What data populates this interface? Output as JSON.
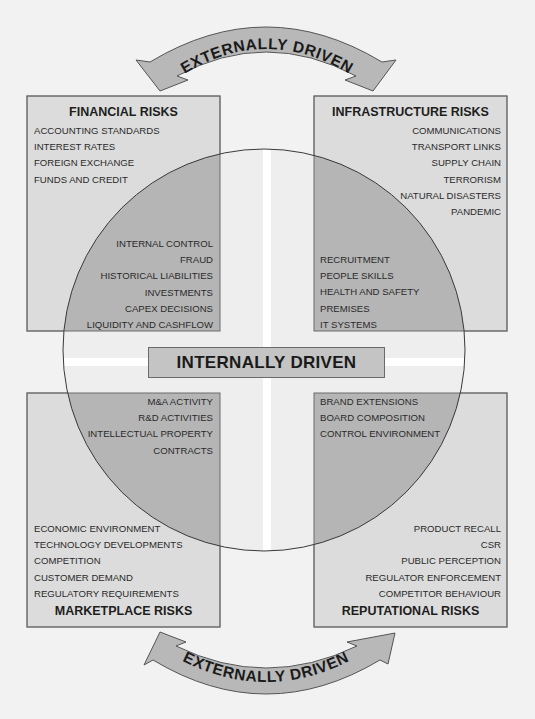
{
  "top_arrow": {
    "label": "EXTERNALLY DRIVEN"
  },
  "bottom_arrow": {
    "label": "EXTERNALLY DRIVEN"
  },
  "center": {
    "label": "INTERNALLY DRIVEN"
  },
  "quadrants": {
    "financial": {
      "title": "FINANCIAL RISKS",
      "external_items": [
        "ACCOUNTING STANDARDS",
        "INTEREST RATES",
        "FOREIGN EXCHANGE",
        "FUNDS AND CREDIT"
      ],
      "internal_items": [
        "INTERNAL CONTROL",
        "FRAUD",
        "HISTORICAL LIABILITIES",
        "INVESTMENTS",
        "CAPEX DECISIONS",
        "LIQUIDITY AND CASHFLOW"
      ]
    },
    "infrastructure": {
      "title": "INFRASTRUCTURE RISKS",
      "external_items": [
        "COMMUNICATIONS",
        "TRANSPORT LINKS",
        "SUPPLY CHAIN",
        "TERRORISM",
        "NATURAL DISASTERS",
        "PANDEMIC"
      ],
      "internal_items": [
        "RECRUITMENT",
        "PEOPLE SKILLS",
        "HEALTH AND SAFETY",
        "PREMISES",
        "IT SYSTEMS"
      ]
    },
    "marketplace": {
      "title": "MARKETPLACE RISKS",
      "internal_items": [
        "M&A ACTIVITY",
        "R&D ACTIVITIES",
        "INTELLECTUAL PROPERTY",
        "CONTRACTS"
      ],
      "external_items": [
        "ECONOMIC ENVIRONMENT",
        "TECHNOLOGY DEVELOPMENTS",
        "COMPETITION",
        "CUSTOMER DEMAND",
        "REGULATORY REQUIREMENTS"
      ]
    },
    "reputational": {
      "title": "REPUTATIONAL RISKS",
      "internal_items": [
        "BRAND EXTENSIONS",
        "BOARD COMPOSITION",
        "CONTROL ENVIRONMENT"
      ],
      "external_items": [
        "PRODUCT RECALL",
        "CSR",
        "PUBLIC PERCEPTION",
        "REGULATOR ENFORCEMENT",
        "COMPETITOR BEHAVIOUR"
      ]
    }
  },
  "colors": {
    "background": "#f2f2f2",
    "box_fill": "#dcdcdc",
    "overlap_fill": "#b5b5b5",
    "arrow_fill": "#b8b8b8",
    "outline": "#6a6a6a"
  }
}
